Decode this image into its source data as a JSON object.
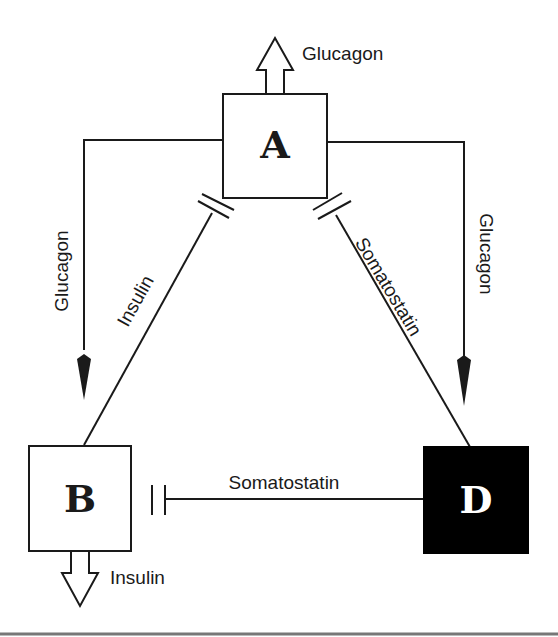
{
  "diagram": {
    "cells": {
      "A": {
        "label": "A",
        "fill": "#ffffff",
        "text_color": "#1a1a1a"
      },
      "B": {
        "label": "B",
        "fill": "#ffffff",
        "text_color": "#1a1a1a"
      },
      "D": {
        "label": "D",
        "fill": "#000000",
        "text_color": "#ffffff"
      }
    },
    "secretions": {
      "A_out": "Glucagon",
      "B_out": "Insulin"
    },
    "edges": [
      {
        "id": "a-to-b",
        "from": "A",
        "to": "B",
        "label": "Glucagon",
        "type": "stimulate"
      },
      {
        "id": "a-to-d",
        "from": "A",
        "to": "D",
        "label": "Glucagon",
        "type": "stimulate"
      },
      {
        "id": "b-to-a",
        "from": "B",
        "to": "A",
        "label": "Insulin",
        "type": "inhibit"
      },
      {
        "id": "d-to-a",
        "from": "D",
        "to": "A",
        "label": "Somatostatin",
        "type": "inhibit"
      },
      {
        "id": "d-to-b",
        "from": "D",
        "to": "B",
        "label": "Somatostatin",
        "type": "inhibit"
      }
    ]
  }
}
